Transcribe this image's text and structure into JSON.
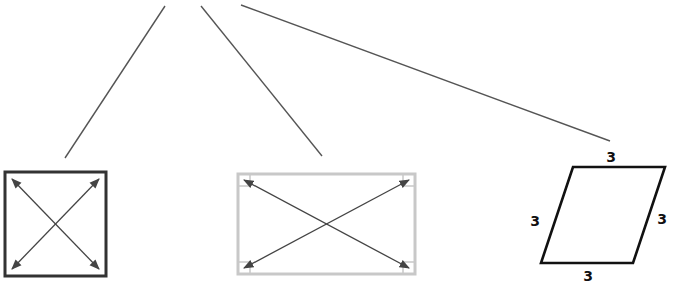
{
  "diagram": {
    "colors": {
      "background": "#ffffff",
      "branch_line": "#555555",
      "square_border": "#333333",
      "rectangle_border": "#c8c8c8",
      "diagonal": "#444444",
      "rhombus_border": "#111111",
      "label": "#111111"
    },
    "branches": [
      {
        "name": "branch-to-square",
        "x1": 165,
        "y1": 6,
        "x2": 65,
        "y2": 158
      },
      {
        "name": "branch-to-rectangle",
        "x1": 201,
        "y1": 6,
        "x2": 322,
        "y2": 156
      },
      {
        "name": "branch-to-rhombus",
        "x1": 241,
        "y1": 5,
        "x2": 610,
        "y2": 141
      }
    ],
    "shapes": {
      "square": {
        "label": "square",
        "x": 5,
        "y": 172,
        "w": 101,
        "h": 104,
        "diagonals": "double-arrow"
      },
      "rectangle": {
        "label": "rectangle",
        "x": 238,
        "y": 174,
        "w": 177,
        "h": 100,
        "diagonals": "double-arrow",
        "right_angle_markers": 4
      },
      "rhombus": {
        "label": "rhombus",
        "points": "573,167 665,167 633,263 541,263",
        "side_labels": [
          {
            "position": "top",
            "text": "3",
            "x": 611,
            "y": 162
          },
          {
            "position": "left",
            "text": "3",
            "x": 535,
            "y": 226
          },
          {
            "position": "right",
            "text": "3",
            "x": 662,
            "y": 224
          },
          {
            "position": "bottom",
            "text": "3",
            "x": 588,
            "y": 281
          }
        ]
      }
    }
  }
}
